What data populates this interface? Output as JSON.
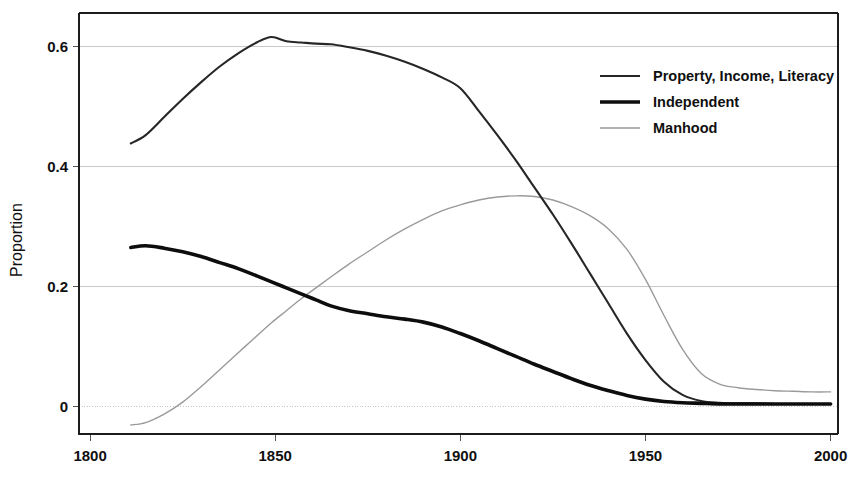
{
  "chart_data": {
    "type": "line",
    "title": "",
    "xlabel": "",
    "ylabel": "Proportion",
    "xlim": [
      1797,
      2002
    ],
    "ylim": [
      -0.045,
      0.655
    ],
    "grid": true,
    "grid_axis": "y",
    "legend_position": "top-right",
    "xticks": [
      1800,
      1850,
      1900,
      1950,
      2000
    ],
    "xtick_labels": [
      "1800",
      "1850",
      "1900",
      "1950",
      "2000"
    ],
    "yticks": [
      0,
      0.2,
      0.4,
      0.6
    ],
    "ytick_labels": [
      "0",
      "0.2",
      "0.4",
      "0.6"
    ],
    "x": [
      1811,
      1815,
      1820,
      1825,
      1830,
      1835,
      1840,
      1845,
      1849,
      1853,
      1857,
      1861,
      1865,
      1870,
      1875,
      1880,
      1885,
      1890,
      1895,
      1900,
      1905,
      1910,
      1915,
      1920,
      1925,
      1930,
      1935,
      1940,
      1945,
      1950,
      1955,
      1960,
      1965,
      1970,
      1975,
      1980,
      1985,
      1990,
      1995,
      2000
    ],
    "series": [
      {
        "name": "Property, Income, Literacy",
        "color": "#262626",
        "line_width": 2.1,
        "values": [
          0.438,
          0.452,
          0.482,
          0.512,
          0.54,
          0.566,
          0.588,
          0.606,
          0.615,
          0.608,
          0.606,
          0.604,
          0.603,
          0.598,
          0.592,
          0.584,
          0.574,
          0.562,
          0.548,
          0.53,
          0.492,
          0.452,
          0.41,
          0.365,
          0.32,
          0.272,
          0.222,
          0.172,
          0.122,
          0.078,
          0.042,
          0.02,
          0.01,
          0.007,
          0.006,
          0.006,
          0.005,
          0.005,
          0.005,
          0.005
        ]
      },
      {
        "name": "Independent",
        "color": "#0d0d0d",
        "line_width": 3.6,
        "values": [
          0.265,
          0.268,
          0.264,
          0.258,
          0.25,
          0.24,
          0.23,
          0.218,
          0.208,
          0.198,
          0.188,
          0.178,
          0.168,
          0.16,
          0.155,
          0.15,
          0.146,
          0.141,
          0.133,
          0.122,
          0.11,
          0.097,
          0.084,
          0.071,
          0.059,
          0.047,
          0.036,
          0.027,
          0.019,
          0.013,
          0.009,
          0.007,
          0.006,
          0.005,
          0.005,
          0.005,
          0.005,
          0.005,
          0.005,
          0.005
        ]
      },
      {
        "name": "Manhood",
        "color": "#9a9a9a",
        "line_width": 1.4,
        "values": [
          -0.03,
          -0.026,
          -0.012,
          0.008,
          0.034,
          0.062,
          0.09,
          0.118,
          0.14,
          0.16,
          0.18,
          0.198,
          0.216,
          0.238,
          0.258,
          0.278,
          0.296,
          0.312,
          0.326,
          0.336,
          0.344,
          0.349,
          0.351,
          0.35,
          0.344,
          0.333,
          0.318,
          0.296,
          0.262,
          0.212,
          0.152,
          0.096,
          0.056,
          0.038,
          0.032,
          0.029,
          0.027,
          0.026,
          0.025,
          0.025
        ]
      }
    ]
  },
  "legend": {
    "entries": [
      {
        "label": "Property, Income, Literacy"
      },
      {
        "label": "Independent"
      },
      {
        "label": "Manhood"
      }
    ]
  },
  "axis": {
    "y_title": "Proportion"
  }
}
